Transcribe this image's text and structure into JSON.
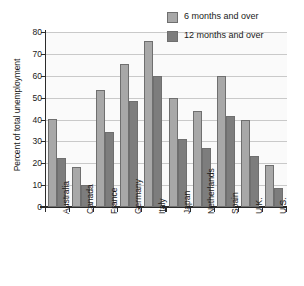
{
  "chart_data": {
    "type": "bar",
    "title": "",
    "xlabel": "",
    "ylabel": "Percent of total unemployment",
    "ylim": [
      0,
      80
    ],
    "yticks": [
      0,
      10,
      20,
      30,
      40,
      50,
      60,
      70,
      80
    ],
    "ytick_labels": [
      "0",
      "10",
      "20",
      "30",
      "40",
      "50",
      "60",
      "70",
      "80"
    ],
    "grid": true,
    "legend_position": "top-right",
    "categories": [
      "Australia",
      "Canada",
      "France",
      "Germany",
      "Italy",
      "Japan",
      "Netherlands",
      "Spain",
      "U.K.",
      "U.S."
    ],
    "series": [
      {
        "name": "6 months and over",
        "color": "#a8a8a8",
        "values": [
          40.2,
          18.3,
          53.4,
          65.2,
          76.0,
          50.0,
          44.1,
          59.8,
          39.6,
          19.1
        ]
      },
      {
        "name": "12 months and over",
        "color": "#7d7d7d",
        "values": [
          22.5,
          10.0,
          34.1,
          48.6,
          60.0,
          31.2,
          27.1,
          41.4,
          23.2,
          8.9
        ]
      }
    ]
  },
  "legend": {
    "items": [
      {
        "label": "6 months and over"
      },
      {
        "label": "12 months and over"
      }
    ]
  },
  "axis": {
    "y_title": "Percent of total unemployment"
  }
}
